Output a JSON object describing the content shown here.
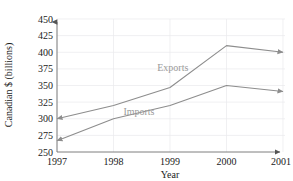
{
  "chart_data": {
    "type": "line",
    "title": "",
    "xlabel": "Year",
    "ylabel": "Canadian $ (billions)",
    "categories": [
      "1997",
      "1998",
      "1999",
      "2000",
      "2001"
    ],
    "x": [
      1997,
      1998,
      1999,
      2000,
      2001
    ],
    "xlim": [
      1997,
      2001
    ],
    "ylim": [
      250,
      450
    ],
    "yticks": [
      250,
      275,
      300,
      325,
      350,
      375,
      400,
      425,
      450
    ],
    "ytick_labels": [
      "250",
      "275",
      "300",
      "325",
      "350",
      "375",
      "400",
      "425",
      "450"
    ],
    "xticks": [
      1997,
      1998,
      1999,
      2000,
      2001
    ],
    "xtick_labels": [
      "1997",
      "1998",
      "1999",
      "2000",
      "2001"
    ],
    "grid": true,
    "legend_position": "inline-annotation",
    "series": [
      {
        "name": "Exports",
        "values": [
          300,
          320,
          347,
          410,
          400
        ],
        "color": "#8d8d8d",
        "label_text": "Exports"
      },
      {
        "name": "Imports",
        "values": [
          267,
          300,
          320,
          350,
          341
        ],
        "color": "#8d8d8d",
        "label_text": "Imports"
      }
    ],
    "annotations": [
      {
        "text": "Exports",
        "x": 1999.05,
        "y": 372
      },
      {
        "text": "Imports",
        "x": 1998.45,
        "y": 305
      }
    ]
  },
  "axes": {
    "y_axis_label": "Canadian $ (billions)",
    "x_axis_label": "Year"
  },
  "colors": {
    "line": "#8d8d8d",
    "grid": "#e9e9ec",
    "axis": "#6f6f6f",
    "text": "#1a1a1a",
    "annotation": "#9a9a9a",
    "background": "#ffffff"
  }
}
